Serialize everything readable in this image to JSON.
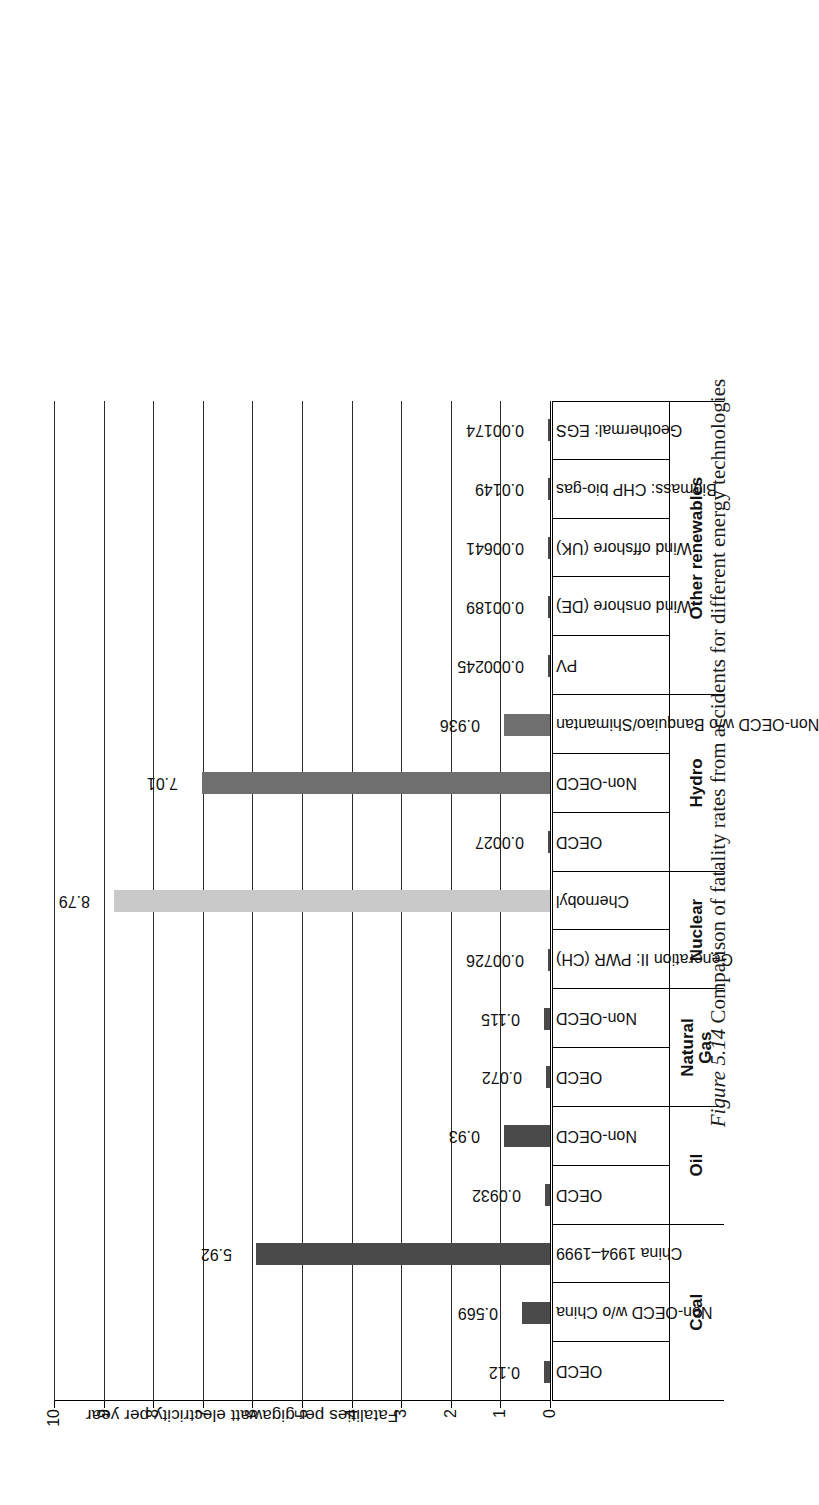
{
  "figure": {
    "number_label": "Figure 5.14",
    "caption": "Comparison of fatality rates from accidents for different energy technologies",
    "full_caption": "Figure 5.14 Comparison of fatality rates from accidents for different energy technologies"
  },
  "chart_data": {
    "type": "bar",
    "title": "",
    "xlabel": "",
    "ylabel": "Fatalities per gigawatt electricity per year",
    "ylim": [
      0,
      10
    ],
    "yticks": [
      "0",
      "1",
      "2",
      "3",
      "4",
      "5",
      "6",
      "7",
      "8",
      "9",
      "10"
    ],
    "grid": true,
    "legend": "none",
    "orientation": "vertical-bars-on-page-rotated-90ccw",
    "categories": [
      "OECD",
      "Non-OECD w/o China",
      "China 1994–1999",
      "OECD",
      "Non-OECD",
      "OECD",
      "Non-OECD",
      "Generation II: PWR (CH)",
      "Chernobyl",
      "OECD",
      "Non-OECD",
      "Non-OECD w/o Banquiao/Shimantan",
      "PV",
      "Wind onshore (DE)",
      "Wind offshore (UK)",
      "Biomass: CHP bio-gas",
      "Geothermal: EGS"
    ],
    "values": [
      0.12,
      0.569,
      5.92,
      0.0932,
      0.93,
      0.072,
      0.115,
      0.00726,
      8.79,
      0.0027,
      7.01,
      0.936,
      0.000245,
      0.00189,
      0.00641,
      0.0149,
      0.00174
    ],
    "value_labels": [
      "0.12",
      "0.569",
      "5.92",
      "0.0932",
      "0.93",
      "0.072",
      "0.115",
      "0.00726",
      "8.79",
      "0.0027",
      "7.01",
      "0.936",
      "0.000245",
      "0.00189",
      "0.00641",
      "0.0149",
      "0.00174"
    ],
    "bar_shades": [
      "dark",
      "dark",
      "dark",
      "dark",
      "dark",
      "dark",
      "dark",
      "dark",
      "light",
      "dark",
      "mid",
      "mid",
      "dark",
      "dark",
      "dark",
      "dark",
      "dark"
    ],
    "groups": [
      {
        "label": "Coal",
        "span": 3
      },
      {
        "label": "Oil",
        "span": 2
      },
      {
        "label": "Natural Gas",
        "span": 2
      },
      {
        "label": "Nuclear",
        "span": 2
      },
      {
        "label": "Hydro",
        "span": 3
      },
      {
        "label": "Other renewables",
        "span": 5
      }
    ]
  },
  "colors": {
    "bar_dark": "#4a4a4a",
    "bar_mid": "#6f6f6f",
    "bar_light": "#c9c9c9",
    "axis": "#000000",
    "background": "#ffffff"
  }
}
